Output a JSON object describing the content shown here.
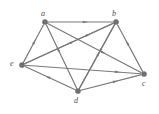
{
  "figure": {
    "kind": "directed-graph",
    "background_color": "#ffffff",
    "stroke_color": "#76787a",
    "node_color": "#6e7073",
    "label_color": "#4a4c4e",
    "width": 159,
    "height": 114
  },
  "nodes": [
    {
      "id": "a",
      "label": "a",
      "x": 45,
      "y": 22,
      "label_x": 41,
      "label_y": 10,
      "r": 2.6
    },
    {
      "id": "b",
      "label": "b",
      "x": 116,
      "y": 22,
      "label_x": 112,
      "label_y": 10,
      "r": 2.6
    },
    {
      "id": "e",
      "label": "e",
      "x": 22,
      "y": 65,
      "label_x": 10,
      "label_y": 60,
      "r": 2.6
    },
    {
      "id": "c",
      "label": "c",
      "x": 144,
      "y": 74,
      "label_x": 142,
      "label_y": 80,
      "r": 2.6
    },
    {
      "id": "d",
      "label": "d",
      "x": 78,
      "y": 91,
      "label_x": 74,
      "label_y": 97,
      "r": 2.6
    }
  ],
  "edges": [
    {
      "id": "a-b",
      "from": "a",
      "to": "b",
      "label": "a to b",
      "arrow_t": 0.58
    },
    {
      "id": "e-a",
      "from": "e",
      "to": "a",
      "label": "e to a",
      "arrow_t": 0.55
    },
    {
      "id": "e-b",
      "from": "e",
      "to": "b",
      "label": "e to b",
      "arrow_t": 0.72
    },
    {
      "id": "e-c",
      "from": "e",
      "to": "c",
      "label": "e to c",
      "arrow_t": 0.8
    },
    {
      "id": "b-d",
      "from": "b",
      "to": "d",
      "label": "b to d",
      "arrow_t": 0.42
    },
    {
      "id": "b-e",
      "from": "b",
      "to": "e",
      "label": "b to e",
      "arrow_t": 0.5
    },
    {
      "id": "c-b",
      "from": "c",
      "to": "b",
      "label": "c to b",
      "arrow_t": 0.62
    },
    {
      "id": "a-c",
      "from": "a",
      "to": "c",
      "label": "a to c",
      "arrow_t": 0.6
    },
    {
      "id": "d-a",
      "from": "d",
      "to": "a",
      "label": "d to a",
      "arrow_t": 0.62
    },
    {
      "id": "d-b",
      "from": "d",
      "to": "b",
      "label": "d to b",
      "arrow_t": 0.55
    },
    {
      "id": "d-c",
      "from": "d",
      "to": "c",
      "label": "d to c",
      "arrow_t": 0.58
    },
    {
      "id": "d-e",
      "from": "d",
      "to": "e",
      "label": "d to e",
      "arrow_t": 0.55
    }
  ],
  "chart_data": {
    "type": "diagram",
    "title": "",
    "graph_type": "directed graph (digraph)",
    "vertices": [
      "a",
      "b",
      "c",
      "d",
      "e"
    ],
    "vertex_count": 5,
    "edge_count": 12,
    "directed_edges": [
      [
        "a",
        "b"
      ],
      [
        "e",
        "a"
      ],
      [
        "e",
        "b"
      ],
      [
        "e",
        "c"
      ],
      [
        "b",
        "d"
      ],
      [
        "b",
        "e"
      ],
      [
        "c",
        "b"
      ],
      [
        "a",
        "c"
      ],
      [
        "d",
        "a"
      ],
      [
        "d",
        "b"
      ],
      [
        "d",
        "c"
      ],
      [
        "d",
        "e"
      ]
    ]
  }
}
